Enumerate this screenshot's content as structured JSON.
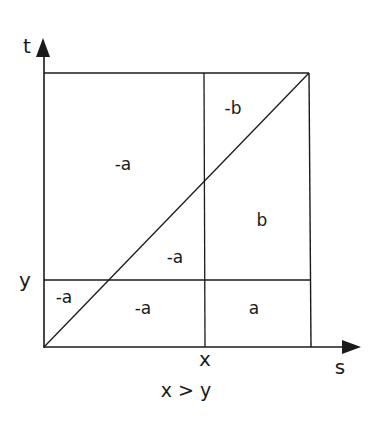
{
  "diagram": {
    "axes": {
      "vertical_label": "t",
      "horizontal_label": "s"
    },
    "tick_labels": {
      "x_tick": "x",
      "y_tick": "y"
    },
    "regions": [
      {
        "id": "upper-left",
        "label": "-a"
      },
      {
        "id": "upper-right-above-diagonal",
        "label": "-b"
      },
      {
        "id": "right-below-diagonal",
        "label": "b"
      },
      {
        "id": "middle-below-diagonal",
        "label": "-a"
      },
      {
        "id": "bottom-left-above-diagonal",
        "label": "-a"
      },
      {
        "id": "bottom-middle",
        "label": "-a"
      },
      {
        "id": "bottom-right",
        "label": "a"
      }
    ],
    "caption": "x > y",
    "colors": {
      "line": "#1a1a1a",
      "background": "#ffffff"
    }
  }
}
